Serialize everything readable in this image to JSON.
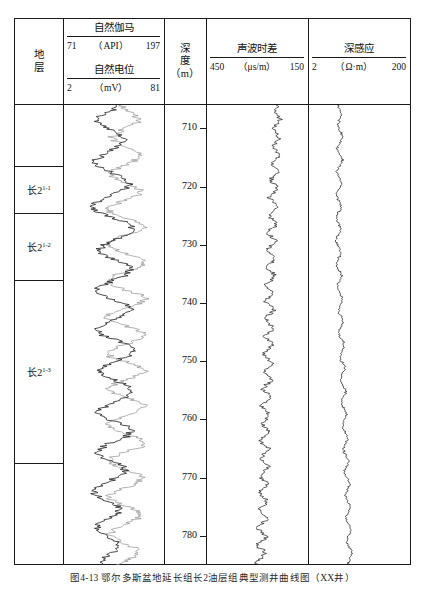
{
  "figure": {
    "caption": "图4-13  鄂尔多斯盆地延长组长2油层组典型测井曲线图（XX井）"
  },
  "columns": {
    "strat": {
      "title_lines": [
        "地",
        "层"
      ]
    },
    "depth": {
      "title_lines": [
        "深",
        "度",
        "（m）"
      ]
    }
  },
  "tracks": [
    {
      "id": "gr-sp",
      "curves": [
        {
          "name": "自然伽马",
          "unit": "（API）",
          "left": "71",
          "right": "197",
          "color": "#2b2b2b"
        },
        {
          "name": "自然电位",
          "unit": "（mV）",
          "left": "2",
          "right": "81",
          "color": "#9a9a9a"
        }
      ]
    },
    {
      "id": "sonic",
      "curves": [
        {
          "name": "声波时差",
          "unit": "（μs/m）",
          "left": "450",
          "right": "150",
          "color": "#2b2b2b"
        }
      ]
    },
    {
      "id": "resistivity",
      "curves": [
        {
          "name": "深感应",
          "unit": "（Ω·m）",
          "left": "2",
          "right": "200",
          "color": "#2b2b2b"
        }
      ]
    }
  ],
  "strat_units": [
    {
      "label": "",
      "sup": "",
      "top_m": 706.0,
      "base_m": 716.5
    },
    {
      "label": "长2",
      "sup": "1-1",
      "top_m": 716.5,
      "base_m": 724.5
    },
    {
      "label": "长2",
      "sup": "1-2",
      "top_m": 724.5,
      "base_m": 736.0
    },
    {
      "label": "长2",
      "sup": "1-3",
      "top_m": 736.0,
      "base_m": 767.5
    },
    {
      "label": "",
      "sup": "",
      "top_m": 767.5,
      "base_m": 785.0
    }
  ],
  "chart_data": {
    "type": "line",
    "orientation": "vertical-depth",
    "ylabel": "深度 (m)",
    "ylim": [
      706,
      785
    ],
    "yticks": [
      710,
      720,
      730,
      740,
      750,
      760,
      770,
      780
    ],
    "grid": false,
    "legend": "none",
    "depth_step_m": 0.5,
    "series": [
      {
        "name": "自然伽马",
        "track": "gr-sp",
        "unit": "API",
        "xlim": [
          71,
          197
        ],
        "color": "#2b2b2b",
        "values": [
          140,
          136,
          128,
          120,
          112,
          108,
          110,
          116,
          124,
          132,
          140,
          146,
          150,
          148,
          142,
          134,
          126,
          118,
          112,
          108,
          106,
          110,
          118,
          128,
          138,
          146,
          152,
          156,
          154,
          148,
          140,
          130,
          120,
          112,
          106,
          102,
          104,
          110,
          120,
          132,
          144,
          154,
          160,
          162,
          158,
          150,
          140,
          130,
          122,
          116,
          112,
          114,
          120,
          130,
          142,
          152,
          158,
          160,
          156,
          148,
          138,
          128,
          120,
          114,
          110,
          112,
          118,
          128,
          140,
          150,
          156,
          158,
          154,
          146,
          136,
          126,
          118,
          112,
          110,
          114,
          122,
          134,
          146,
          156,
          162,
          164,
          160,
          152,
          142,
          132,
          124,
          118,
          114,
          116,
          122,
          132,
          144,
          154,
          160,
          162,
          158,
          150,
          140,
          130,
          122,
          116,
          112,
          114,
          120,
          130,
          142,
          152,
          158,
          160,
          156,
          148,
          138,
          128,
          120,
          114,
          110,
          112,
          118,
          128,
          138,
          146,
          150,
          148,
          142,
          134,
          126,
          118,
          112,
          108,
          106,
          110,
          118,
          128,
          136,
          142,
          144,
          140,
          134,
          126,
          118,
          112,
          108,
          110,
          116,
          124,
          132,
          138,
          142,
          140,
          136,
          130,
          124,
          118,
          114,
          112
        ]
      },
      {
        "name": "自然电位",
        "track": "gr-sp",
        "unit": "mV",
        "xlim": [
          2,
          81
        ],
        "color": "#9a9a9a",
        "values": [
          48,
          50,
          54,
          58,
          62,
          64,
          62,
          58,
          52,
          46,
          42,
          40,
          42,
          46,
          52,
          58,
          63,
          66,
          66,
          62,
          56,
          50,
          44,
          40,
          38,
          40,
          45,
          52,
          59,
          64,
          66,
          64,
          58,
          51,
          44,
          39,
          36,
          38,
          44,
          52,
          60,
          66,
          68,
          66,
          60,
          52,
          45,
          40,
          37,
          38,
          43,
          50,
          58,
          64,
          68,
          68,
          64,
          57,
          49,
          42,
          38,
          36,
          39,
          45,
          53,
          61,
          67,
          69,
          67,
          61,
          53,
          45,
          39,
          36,
          37,
          42,
          50,
          58,
          65,
          69,
          69,
          65,
          58,
          50,
          43,
          38,
          36,
          39,
          46,
          54,
          62,
          67,
          69,
          67,
          61,
          53,
          45,
          39,
          36,
          38,
          44,
          52,
          60,
          66,
          69,
          68,
          63,
          55,
          47,
          41,
          37,
          36,
          40,
          47,
          55,
          63,
          68,
          69,
          66,
          59,
          51,
          44,
          39,
          37,
          39,
          45,
          53,
          60,
          66,
          68,
          66,
          61,
          54,
          47,
          41,
          38,
          38,
          42,
          48,
          55,
          61,
          65,
          66,
          63,
          58,
          51,
          45,
          40,
          38,
          39,
          43,
          49,
          55,
          60,
          63,
          63,
          60,
          55,
          50,
          46
        ]
      },
      {
        "name": "声波时差",
        "track": "sonic",
        "unit": "μs/m",
        "xlim": [
          450,
          150
        ],
        "color": "#2b2b2b",
        "values": [
          232,
          236,
          241,
          238,
          230,
          224,
          228,
          236,
          244,
          238,
          230,
          226,
          231,
          239,
          246,
          240,
          232,
          227,
          233,
          242,
          250,
          244,
          236,
          230,
          236,
          246,
          256,
          248,
          238,
          232,
          238,
          250,
          262,
          252,
          240,
          233,
          240,
          252,
          264,
          254,
          242,
          234,
          241,
          254,
          266,
          256,
          244,
          236,
          243,
          256,
          268,
          258,
          246,
          238,
          245,
          258,
          270,
          260,
          248,
          240,
          247,
          260,
          272,
          262,
          250,
          242,
          249,
          262,
          274,
          264,
          252,
          244,
          251,
          264,
          276,
          266,
          254,
          246,
          253,
          266,
          278,
          268,
          256,
          248,
          255,
          268,
          280,
          270,
          258,
          250,
          257,
          270,
          282,
          272,
          260,
          252,
          259,
          272,
          284,
          274,
          262,
          254,
          261,
          274,
          286,
          276,
          264,
          256,
          263,
          276,
          288,
          278,
          266,
          258,
          265,
          278,
          290,
          280,
          268,
          260,
          267,
          280,
          292,
          282,
          270,
          262,
          269,
          282,
          294,
          284,
          272,
          264,
          271,
          284,
          296,
          286,
          274,
          266,
          273,
          286,
          298,
          288,
          276,
          268,
          275,
          288,
          300,
          290,
          278,
          270,
          277,
          290,
          302,
          292,
          280,
          272,
          279,
          292,
          304,
          294
        ]
      },
      {
        "name": "深感应",
        "track": "resistivity",
        "unit": "Ω·m",
        "xlim": [
          2,
          200
        ],
        "color": "#2b2b2b",
        "values": [
          52,
          55,
          58,
          60,
          59,
          56,
          53,
          51,
          53,
          57,
          61,
          63,
          61,
          57,
          53,
          50,
          52,
          56,
          60,
          62,
          60,
          56,
          52,
          49,
          51,
          55,
          59,
          61,
          59,
          55,
          51,
          48,
          50,
          54,
          58,
          60,
          58,
          54,
          50,
          47,
          49,
          53,
          57,
          59,
          57,
          53,
          49,
          47,
          49,
          53,
          57,
          59,
          57,
          53,
          50,
          48,
          50,
          54,
          58,
          60,
          58,
          55,
          52,
          50,
          52,
          56,
          60,
          62,
          60,
          57,
          54,
          52,
          54,
          58,
          62,
          64,
          62,
          59,
          56,
          54,
          56,
          60,
          64,
          66,
          64,
          61,
          58,
          56,
          58,
          62,
          66,
          68,
          66,
          63,
          60,
          58,
          60,
          64,
          68,
          70,
          68,
          65,
          62,
          60,
          62,
          66,
          70,
          72,
          70,
          67,
          64,
          62,
          64,
          68,
          72,
          74,
          72,
          69,
          66,
          64,
          66,
          70,
          74,
          76,
          74,
          71,
          68,
          66,
          68,
          72,
          76,
          78,
          76,
          73,
          70,
          68,
          70,
          74,
          78,
          80,
          78,
          75,
          72,
          70,
          72,
          76,
          80,
          82,
          80,
          77,
          74,
          72,
          74,
          78,
          82,
          84,
          82,
          79,
          76,
          74
        ]
      }
    ]
  }
}
